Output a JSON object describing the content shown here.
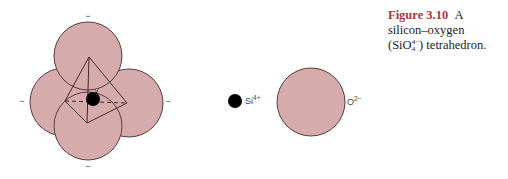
{
  "caption": {
    "figure_label": "Figure 3.10",
    "lead": "A",
    "line2": "silicon–oxygen",
    "formula_open": "(SiO",
    "formula_sub": "4",
    "formula_sup": "4−",
    "formula_close": ") tetrahedron."
  },
  "labels": {
    "si_ion": "Si",
    "si_charge": "4+",
    "o_ion": "O",
    "o_charge": "2−",
    "minus": "−"
  },
  "colors": {
    "sphere_fill": "#d6abab",
    "sphere_stroke": "#5a3b3b",
    "ion_fill": "#000000",
    "caption_accent": "#b5343a"
  },
  "geometry": {
    "tetra_spheres": [
      {
        "name": "left",
        "cx": 64,
        "cy": 102,
        "r": 34
      },
      {
        "name": "right",
        "cx": 129,
        "cy": 103,
        "r": 34
      },
      {
        "name": "top",
        "cx": 88,
        "cy": 56,
        "r": 34
      },
      {
        "name": "bottom",
        "cx": 88,
        "cy": 126,
        "r": 34
      }
    ],
    "si_center": {
      "cx": 93,
      "cy": 99,
      "r": 7
    },
    "tetra_vertices": {
      "apex": [
        89,
        57
      ],
      "left": [
        65,
        101
      ],
      "right": [
        127,
        103
      ],
      "bottom": [
        87,
        123
      ]
    },
    "standalone_si": {
      "cx": 235,
      "cy": 101,
      "r": 7
    },
    "standalone_o": {
      "cx": 311,
      "cy": 102,
      "r": 34
    }
  }
}
